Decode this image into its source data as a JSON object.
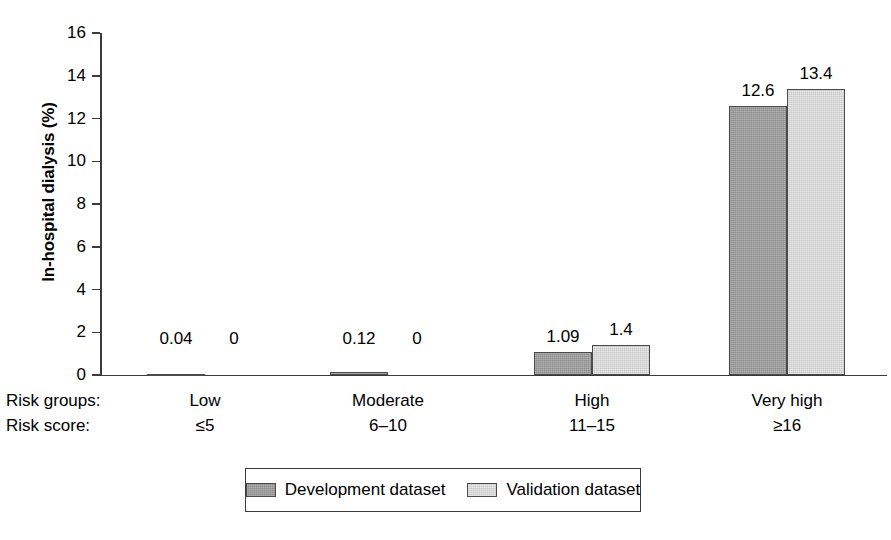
{
  "chart_data": {
    "type": "bar",
    "title": "",
    "xlabel": "",
    "ylabel": "In-hospital dialysis (%)",
    "ylim": [
      0,
      16
    ],
    "yticks": [
      "0",
      "2",
      "4",
      "6",
      "8",
      "10",
      "12",
      "14",
      "16"
    ],
    "grid": false,
    "legend_position": "bottom",
    "categories": [
      "Low",
      "Moderate",
      "High",
      "Very high"
    ],
    "risk_scores": [
      "≤5",
      "6–10",
      "11–15",
      "≥16"
    ],
    "row_labels": {
      "groups": "Risk groups:",
      "scores": "Risk score:"
    },
    "series": [
      {
        "name": "Development dataset",
        "color": "#9e9e9e",
        "values": [
          0.04,
          0.12,
          1.09,
          12.6
        ],
        "labels": [
          "0.04",
          "0.12",
          "1.09",
          "12.6"
        ]
      },
      {
        "name": "Validation dataset",
        "color": "#dcdcdc",
        "values": [
          0,
          0,
          1.4,
          13.4
        ],
        "labels": [
          "0",
          "0",
          "1.4",
          "13.4"
        ]
      }
    ]
  },
  "axis": {
    "y_title": "In-hospital dialysis (%)",
    "ticks": [
      "16",
      "14",
      "12",
      "10",
      "8",
      "6",
      "4",
      "2",
      "0"
    ]
  },
  "legend": {
    "items": [
      {
        "label": "Development dataset",
        "color": "#9e9e9e"
      },
      {
        "label": "Validation dataset",
        "color": "#dcdcdc"
      }
    ]
  },
  "colors": {
    "development": "#9e9e9e",
    "validation": "#dcdcdc",
    "axis": "#3b3b3b",
    "bar_outline": "#4a4a4a",
    "background": "#ffffff"
  }
}
